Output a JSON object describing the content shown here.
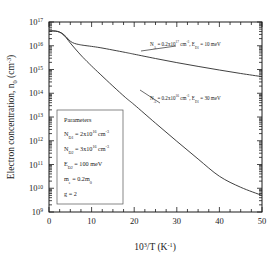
{
  "chart_data": {
    "type": "line",
    "title": "",
    "xlabel": "10^3/T (K^-1)",
    "ylabel": "Electron concentration, n0 (cm^-3)",
    "xlim": [
      0,
      50
    ],
    "ylim": [
      1000000000.0,
      1e+17
    ],
    "yscale": "log",
    "grid": false,
    "legend_position": "inline-annotations",
    "xticks": [
      0,
      10,
      20,
      30,
      40,
      50
    ],
    "xticklabels": [
      "0",
      "10",
      "20",
      "30",
      "40",
      "50"
    ],
    "yticks": [
      1000000000.0,
      10000000000.0,
      100000000000.0,
      1000000000000.0,
      10000000000000.0,
      100000000000000.0,
      1000000000000000.0,
      1e+16,
      1e+17
    ],
    "yticklabels": [
      "10^9",
      "10^10",
      "10^11",
      "10^12",
      "10^13",
      "10^14",
      "10^15",
      "10^16",
      "10^17"
    ],
    "series": [
      {
        "name": "NA = 0.2x10^17 cm^-3, ED1 = 10 meV",
        "x": [
          0,
          1,
          2,
          3,
          4,
          5,
          6,
          7,
          8,
          10,
          12,
          15,
          18,
          20,
          25,
          30,
          35,
          40,
          45,
          50
        ],
        "y": [
          4.2e+16,
          4.2e+16,
          4e+16,
          3.4e+16,
          2.4e+16,
          1.55e+16,
          1.25e+16,
          1.13e+16,
          1.05e+16,
          9400000000000000.0,
          8300000000000000.0,
          6600000000000000.0,
          5200000000000000.0,
          4400000000000000.0,
          2900000000000000.0,
          1950000000000000.0,
          1350000000000000.0,
          950000000000000.0,
          680000000000000.0,
          500000000000000.0
        ]
      },
      {
        "name": "NA = 0.2x10^16 cm^-3, ED1 = 30 meV",
        "x": [
          0,
          1,
          2,
          3,
          4,
          5,
          6,
          7,
          8,
          10,
          12,
          15,
          18,
          20,
          25,
          30,
          35,
          40,
          45,
          50
        ],
        "y": [
          4.2e+16,
          4.2e+16,
          4e+16,
          3.3e+16,
          2.2e+16,
          1.3e+16,
          8000000000000000.0,
          5000000000000000.0,
          3200000000000000.0,
          1400000000000000.0,
          640000000000000.0,
          200000000000000.0,
          65000000000000.0,
          33000000000000.0,
          5500000000000.0,
          950000000000.0,
          170000000000.0,
          32000000000.0,
          11000000000.0,
          5000000000.0
        ]
      }
    ],
    "annotations": [
      {
        "name": "upper-curve-label",
        "text_parts": [
          "N",
          "A",
          " = 0.2x10",
          "17",
          " cm",
          "-3",
          ", E",
          "D1",
          " = 10 meV"
        ]
      },
      {
        "name": "lower-curve-label",
        "text_parts": [
          "N",
          "A",
          " = 0.2x10",
          "16",
          " cm",
          "-3",
          ", E",
          "D1",
          " = 30 meV"
        ]
      }
    ],
    "parameters_box": {
      "title": "Parameters",
      "lines": [
        {
          "sym": "N",
          "sym_sub": "D1",
          "eq": " = 2x10",
          "exp": "16",
          "unit": " cm",
          "unit_exp": "-3"
        },
        {
          "sym": "N",
          "sym_sub": "D2",
          "eq": " = 3x10",
          "exp": "16",
          "unit": " cm",
          "unit_exp": "-3"
        },
        {
          "sym": "E",
          "sym_sub": "D2",
          "eq": " = 100 meV",
          "exp": "",
          "unit": "",
          "unit_exp": ""
        },
        {
          "sym": "m",
          "sym_sub": "e",
          "eq": " = 0.2m",
          "exp": "",
          "unit": "0",
          "unit_exp": ""
        },
        {
          "sym": "g",
          "sym_sub": "",
          "eq": " = 2",
          "exp": "",
          "unit": "",
          "unit_exp": ""
        }
      ]
    },
    "colors": {
      "axis": "#1a1a1a",
      "curve": "#2b2b2b",
      "background": "#ffffff",
      "box_border": "#555555"
    }
  }
}
